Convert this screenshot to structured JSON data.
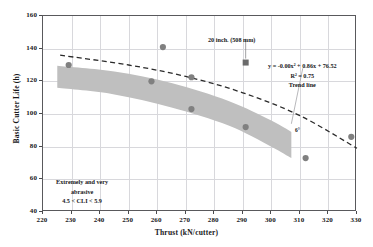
{
  "chart_data": {
    "type": "scatter",
    "title": "",
    "xlabel": "Thrust  (kN/cutter)",
    "ylabel": "Basic Cutter Life (h)",
    "xlim": [
      220,
      330
    ],
    "ylim": [
      40,
      160
    ],
    "xticks": [
      220,
      230,
      240,
      250,
      260,
      270,
      280,
      290,
      300,
      310,
      320,
      330
    ],
    "yticks": [
      40,
      60,
      80,
      100,
      120,
      140,
      160
    ],
    "grid": true,
    "legend": "none",
    "series": [
      {
        "name": "Basic cutter life data",
        "marker": "circle",
        "color": "#808080",
        "points": [
          {
            "x": 229,
            "y": 130
          },
          {
            "x": 258,
            "y": 120
          },
          {
            "x": 262,
            "y": 141
          },
          {
            "x": 272,
            "y": 122.5
          },
          {
            "x": 272,
            "y": 103
          },
          {
            "x": 291,
            "y": 92
          },
          {
            "x": 312,
            "y": 73
          },
          {
            "x": 328,
            "y": 86
          }
        ]
      },
      {
        "name": "20 inch. (508 mm) cutter",
        "marker": "square",
        "color": "#6b6b6b",
        "points": [
          {
            "x": 291,
            "y": 131.5
          }
        ]
      }
    ],
    "band": {
      "name": "Extremely and very abrasive range band",
      "color": "#bfbfbf",
      "upper": [
        {
          "x": 225,
          "y": 129.5
        },
        {
          "x": 245,
          "y": 126
        },
        {
          "x": 265,
          "y": 119
        },
        {
          "x": 285,
          "y": 108
        },
        {
          "x": 300,
          "y": 96
        },
        {
          "x": 307,
          "y": 89
        }
      ],
      "lower": [
        {
          "x": 225,
          "y": 116
        },
        {
          "x": 245,
          "y": 112
        },
        {
          "x": 265,
          "y": 104
        },
        {
          "x": 285,
          "y": 93
        },
        {
          "x": 300,
          "y": 80
        },
        {
          "x": 307,
          "y": 73
        }
      ]
    },
    "trend_line": {
      "name": "Trend line",
      "style": "dashed",
      "color": "#2b2b2b",
      "equation": "y = -0.00x² + 0.86x + 76.52",
      "r_squared": "R² = 0.75",
      "points": [
        {
          "x": 226,
          "y": 136
        },
        {
          "x": 250,
          "y": 130
        },
        {
          "x": 270,
          "y": 123
        },
        {
          "x": 290,
          "y": 113
        },
        {
          "x": 310,
          "y": 99
        },
        {
          "x": 330,
          "y": 79
        }
      ]
    },
    "annotations": [
      {
        "name": "cutter-size-label",
        "text": "20 inch. (508 mm)"
      },
      {
        "name": "abrasive-label-line1",
        "text": "Extremely and very"
      },
      {
        "name": "abrasive-label-line2",
        "text": "abrasive"
      },
      {
        "name": "abrasive-label-line3",
        "text": "4.5 < CLI < 5.9"
      },
      {
        "name": "trend-line-label",
        "text": "Trend line"
      },
      {
        "name": "angle-label",
        "text": "6°"
      }
    ]
  },
  "axes": {
    "x_title": "Thrust  (kN/cutter)",
    "y_title": "Basic Cutter Life (h)",
    "x_ticks": [
      "220",
      "230",
      "240",
      "250",
      "260",
      "270",
      "280",
      "290",
      "300",
      "310",
      "320",
      "330"
    ],
    "y_ticks": [
      "160",
      "140",
      "120",
      "100",
      "80",
      "60",
      "40"
    ]
  },
  "labels": {
    "cutter_size": "20 inch. (508 mm)",
    "equation": "y = -0.00x² + 0.86x + 76.52",
    "r_squared": "R² = 0.75",
    "trend_line": "Trend line",
    "abrasive_1": "Extremely and very",
    "abrasive_2": "abrasive",
    "abrasive_3": "4.5 < CLI < 5.9",
    "angle": "6°"
  },
  "colors": {
    "band": "#bfbfbf",
    "marker": "#808080",
    "square_marker": "#6b6b6b",
    "trend": "#2b2b2b",
    "grid": "#d8d8dc",
    "frame": "#59595c"
  }
}
